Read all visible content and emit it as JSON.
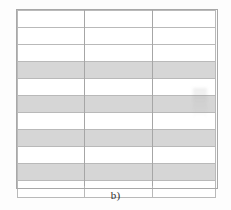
{
  "figure": {
    "caption": "b)",
    "background_color": "#fdfdfd"
  },
  "table": {
    "columns": 3,
    "rows": 11,
    "border_color": "#b9b9b9",
    "shaded_row_color": "#d6d6d6",
    "unshaded_row_color": "#ffffff",
    "column_headers": [
      "",
      "",
      ""
    ],
    "cells": [
      [
        "",
        "",
        ""
      ],
      [
        "",
        "",
        ""
      ],
      [
        "",
        "",
        ""
      ],
      [
        "",
        "",
        ""
      ],
      [
        "",
        "",
        ""
      ],
      [
        "",
        "",
        ""
      ],
      [
        "",
        "",
        ""
      ],
      [
        "",
        "",
        ""
      ],
      [
        "",
        "",
        ""
      ],
      [
        "",
        "",
        ""
      ],
      [
        "",
        "",
        ""
      ]
    ],
    "row_shading": [
      false,
      false,
      false,
      true,
      false,
      true,
      false,
      true,
      false,
      true,
      false
    ]
  }
}
